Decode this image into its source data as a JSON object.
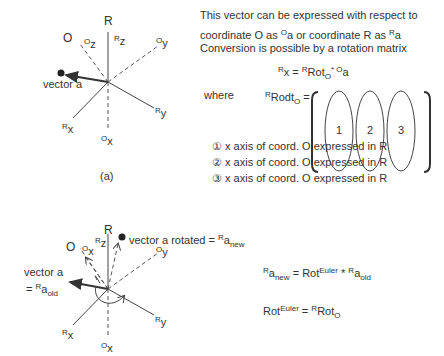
{
  "diagram_a": {
    "caption": "(a)",
    "frame_label": "R",
    "other_frame_label": "O",
    "axes": {
      "Rz": {
        "pre": "R",
        "main": "z"
      },
      "Ry": {
        "pre": "R",
        "main": "y"
      },
      "Rx": {
        "pre": "R",
        "main": "x"
      },
      "Oz": {
        "pre": "O",
        "main": "z"
      },
      "Oy": {
        "pre": "O",
        "main": "y"
      },
      "Ox": {
        "pre": "O",
        "main": "x"
      }
    },
    "vector_label": "vector a"
  },
  "description": {
    "line1": "This vector can be expressed with respect to",
    "line2_a": "coordinate O as ",
    "line2_sup1": "O",
    "line2_b": "a or coordinate R as ",
    "line2_sup2": "R",
    "line2_c": "a",
    "line3": "Conversion is possible by a rotation matrix"
  },
  "equation1": {
    "lhs_sup": "R",
    "lhs": "x = ",
    "rot_sup": "R",
    "rot": "Rot",
    "rot_sub": "O",
    "op": "* ",
    "rhs_sup": "O",
    "rhs": "a"
  },
  "matrix_def": {
    "where": "where",
    "lhs_sup": "R",
    "lhs": "Rodt",
    "lhs_sub": "O",
    "eq": " =",
    "columns": [
      "1",
      "2",
      "3"
    ]
  },
  "legend": [
    {
      "marker": "①",
      "text": "x axis of coord. O expressed in R"
    },
    {
      "marker": "②",
      "text": "x axis of coord. O expressed in R"
    },
    {
      "marker": "③",
      "text": "x axis of coord. O expressed in R"
    }
  ],
  "diagram_b": {
    "frame_label": "R",
    "other_frame_label": "O",
    "axes": {
      "Rz": {
        "pre": "R",
        "main": "z"
      },
      "Ry": {
        "pre": "R",
        "main": "y"
      },
      "Rx": {
        "pre": "R",
        "main": "x"
      },
      "Ox_top": {
        "pre": "O",
        "main": "x"
      },
      "Oy": {
        "pre": "O",
        "main": "y"
      },
      "Ox": {
        "pre": "O",
        "main": "x"
      }
    },
    "vector_old_line1": "vector a",
    "vector_old_line2_pre": "= ",
    "vector_old_sup": "R",
    "vector_old_main": "a",
    "vector_old_sub": "old",
    "vector_new_text": "vector a rotated = ",
    "vector_new_sup": "R",
    "vector_new_main": "a",
    "vector_new_sub": "new"
  },
  "equation2": {
    "lhs_sup": "R",
    "lhs": "a",
    "lhs_sub": "new",
    "eq": " =  Rot",
    "rot_sup": "Euler",
    "op": " * ",
    "rhs_sup": "R",
    "rhs": "a",
    "rhs_sub": "old"
  },
  "equation3": {
    "lhs": "Rot",
    "lhs_sup": "Euler",
    "eq": " =  ",
    "rhs_sup": "R",
    "rhs": "Rot",
    "rhs_sub": "O"
  }
}
